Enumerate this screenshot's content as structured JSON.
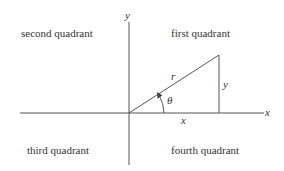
{
  "quadrants": {
    "first": "first quadrant",
    "second": "second quadrant",
    "third": "third quadrant",
    "fourth": "fourth quadrant"
  },
  "axes": {
    "x_label": "x",
    "y_label": "y"
  },
  "triangle": {
    "hypotenuse_label": "r",
    "opposite_label": "y",
    "adjacent_label": "x",
    "angle_label": "θ"
  },
  "colors": {
    "stroke": "#444444",
    "text": "#333333"
  }
}
